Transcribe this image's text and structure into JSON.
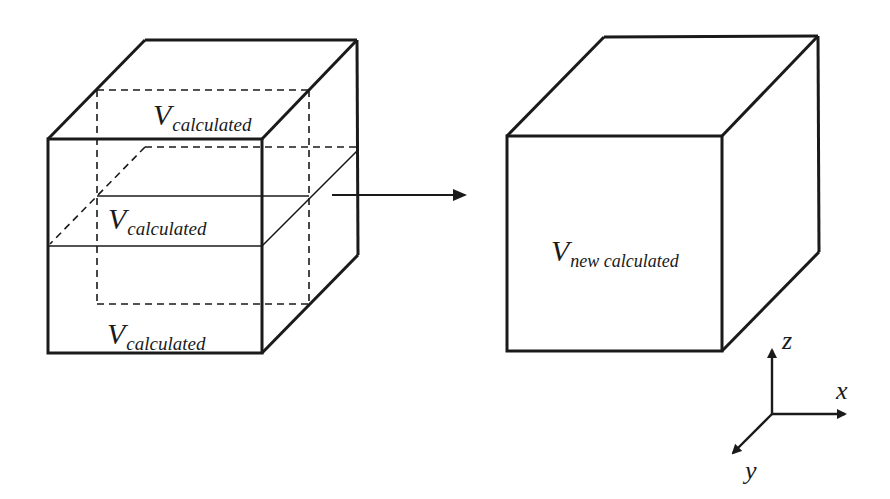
{
  "diagram": {
    "type": "volume-merging-illustration",
    "left_cube": {
      "layers": [
        {
          "symbol": "V",
          "subscript": "calculated",
          "position": "top"
        },
        {
          "symbol": "V",
          "subscript": "calculated",
          "position": "middle"
        },
        {
          "symbol": "V",
          "subscript": "calculated",
          "position": "bottom"
        }
      ]
    },
    "arrow": {
      "direction": "right"
    },
    "right_cube": {
      "label": {
        "symbol": "V",
        "subscript": "new calculated"
      }
    },
    "axes": {
      "z": "z",
      "x": "x",
      "y": "y"
    },
    "colors": {
      "stroke": "#1a1a1a",
      "background": "#ffffff"
    }
  }
}
